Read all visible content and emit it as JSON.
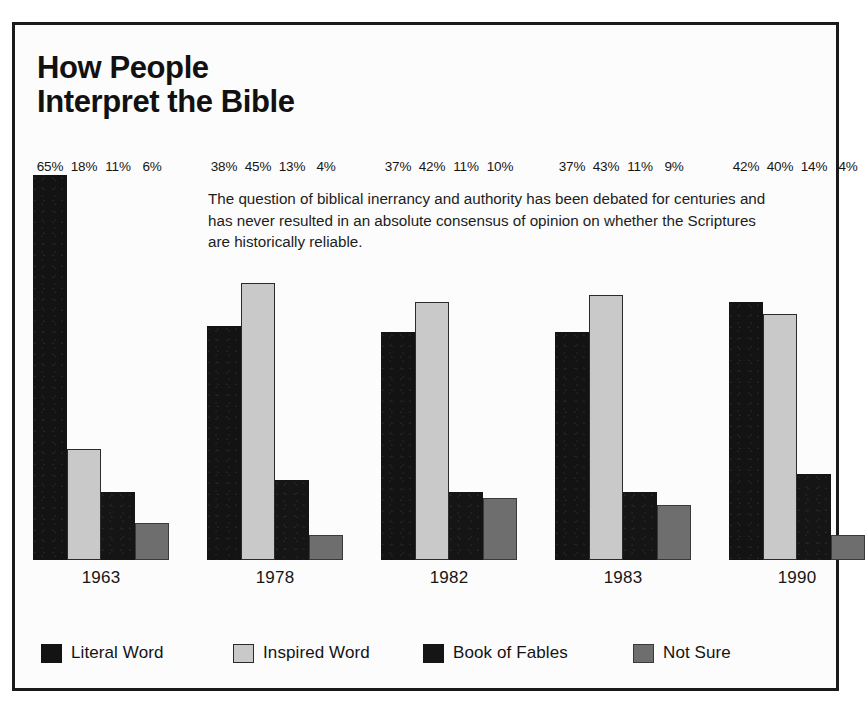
{
  "figure": {
    "title_lines": [
      "How People",
      "Interpret the Bible"
    ],
    "blurb": "The question of biblical inerrancy and authority has been debated for centuries and has never resulted in an absolute consensus of opinion on whether the Scriptures are historically reliable."
  },
  "colors": {
    "literal_word": "#131313",
    "inspired_word": "#c9c9c9",
    "book_of_fables": "#151515",
    "not_sure": "#6e6e6e",
    "frame": "#1a1a1a",
    "paper": "#fcfcfc",
    "text": "#141414"
  },
  "chart_data": {
    "type": "bar",
    "title": "How People Interpret the Bible",
    "subtitle": "The question of biblical inerrancy and authority has been debated for centuries and has never resulted in an absolute consensus of opinion on whether the Scriptures are historically reliable.",
    "xlabel": "",
    "ylabel": "",
    "ylim": [
      0,
      65
    ],
    "grid": false,
    "legend_position": "bottom",
    "value_suffix": "%",
    "categories": [
      "1963",
      "1978",
      "1982",
      "1983",
      "1990"
    ],
    "series": [
      {
        "name": "Literal Word",
        "color": "#131313",
        "values": [
          65,
          38,
          37,
          37,
          42
        ],
        "labels": [
          "65%",
          "38%",
          "37%",
          "37%",
          "42%"
        ]
      },
      {
        "name": "Inspired Word",
        "color": "#c9c9c9",
        "values": [
          18,
          45,
          42,
          43,
          40
        ],
        "labels": [
          "18%",
          "45%",
          "42%",
          "43%",
          "40%"
        ]
      },
      {
        "name": "Book of Fables",
        "color": "#151515",
        "values": [
          11,
          13,
          11,
          11,
          14
        ],
        "labels": [
          "11%",
          "13%",
          "11%",
          "11%",
          "14%"
        ]
      },
      {
        "name": "Not Sure",
        "color": "#6e6e6e",
        "values": [
          6,
          4,
          10,
          9,
          4
        ],
        "labels": [
          "6%",
          "4%",
          "10%",
          "9%",
          "4%"
        ]
      }
    ]
  }
}
